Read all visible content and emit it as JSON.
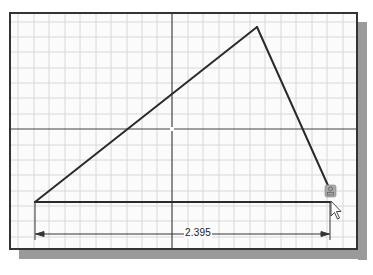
{
  "viewport": {
    "title": "2D sketch canvas"
  },
  "colors": {
    "background": "#fbfbfb",
    "grid_minor": "#d8d8d8",
    "axis": "#333333",
    "sketch_line": "#2a2a2a",
    "shadow": "#9a9a9a",
    "constraint_icon": "#a8a8a8"
  },
  "sketch": {
    "points": [
      {
        "name": "P1",
        "x": 35,
        "y": 202
      },
      {
        "name": "P2",
        "x": 257,
        "y": 27
      },
      {
        "name": "P3",
        "x": 330,
        "y": 190
      },
      {
        "name": "P4",
        "x": 330,
        "y": 202
      }
    ],
    "lines": [
      {
        "from": "P1",
        "to": "P2"
      },
      {
        "from": "P2",
        "to": "P3"
      },
      {
        "from": "P1",
        "to": "P4"
      }
    ]
  },
  "dimension": {
    "value": "2.395",
    "start_x": 35,
    "end_x": 330,
    "y": 234
  },
  "cursor": {
    "icon": "arrow-pointer-icon",
    "constraint_glyph": "coincident-constraint-icon"
  }
}
